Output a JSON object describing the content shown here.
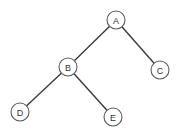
{
  "diagram": {
    "type": "binary-tree",
    "nodes": [
      {
        "id": "A",
        "label": "A"
      },
      {
        "id": "B",
        "label": "B"
      },
      {
        "id": "C",
        "label": "C"
      },
      {
        "id": "D",
        "label": "D"
      },
      {
        "id": "E",
        "label": "E"
      }
    ],
    "edges": [
      {
        "from": "A",
        "to": "B"
      },
      {
        "from": "A",
        "to": "C"
      },
      {
        "from": "B",
        "to": "D"
      },
      {
        "from": "B",
        "to": "E"
      }
    ]
  }
}
